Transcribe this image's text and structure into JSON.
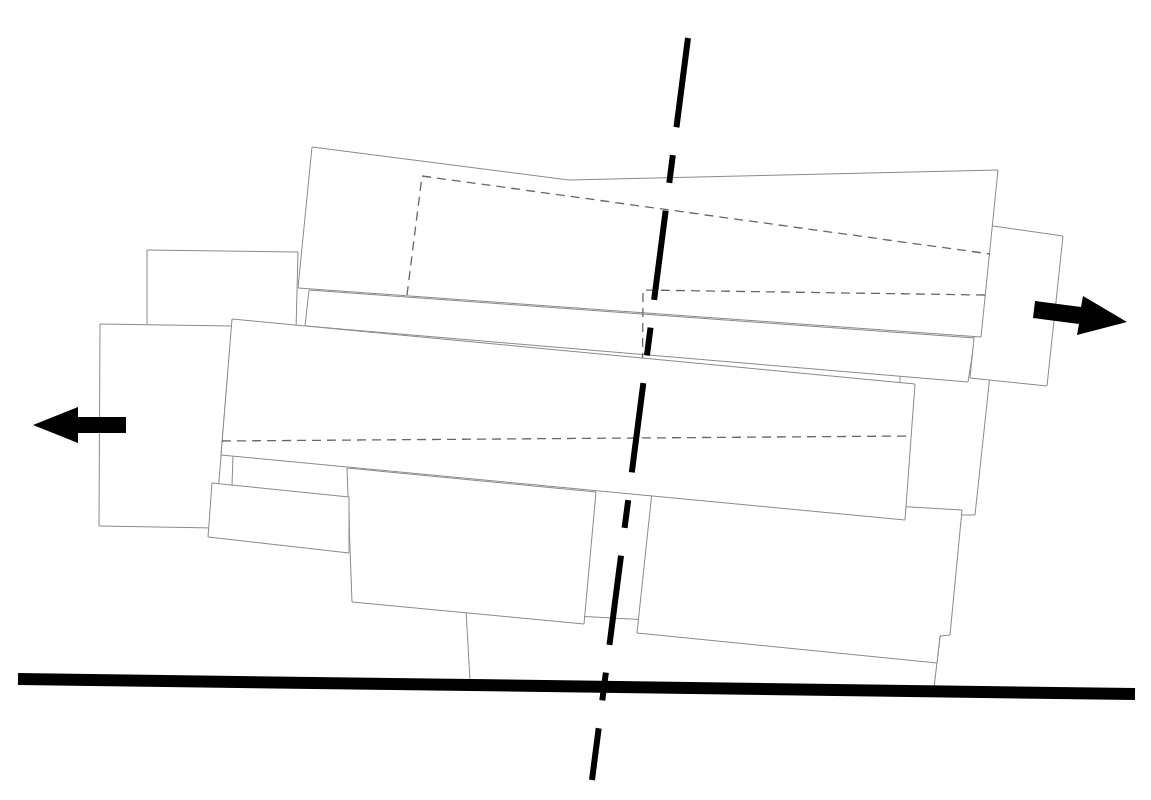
{
  "diagram": {
    "type": "architectural-massing-plan",
    "background": "#ffffff",
    "line_color": "#8a8a8a",
    "hidden_line_color": "#666666",
    "ground_line": {
      "color": "#000000",
      "from": [
        18,
        679
      ],
      "to": [
        1135,
        694
      ]
    },
    "axis": {
      "style": "dash-dot",
      "color": "#000000",
      "from": [
        688,
        38
      ],
      "to": [
        592,
        780
      ]
    },
    "arrows": [
      {
        "name": "expand-left-arrow",
        "direction": "left",
        "tip": [
          33,
          425
        ]
      },
      {
        "name": "expand-right-arrow",
        "direction": "right",
        "tip": [
          1127,
          322
        ]
      }
    ],
    "volumes": [
      "upper-slab",
      "upper-right-block",
      "upper-left-block",
      "middle-slab",
      "left-block",
      "lower-left-small-block",
      "lower-center-block",
      "lower-right-block",
      "ground-base-block",
      "right-mid-block"
    ]
  }
}
